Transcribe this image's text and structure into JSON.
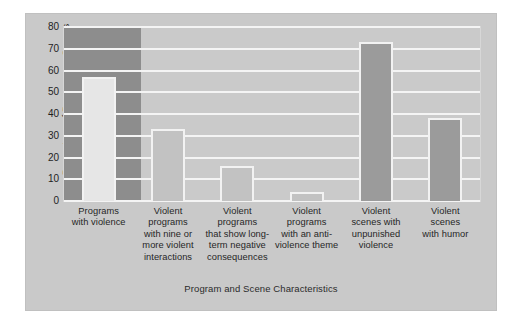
{
  "chart_data": {
    "type": "bar",
    "title": "",
    "xlabel": "Program and Scene Characteristics",
    "ylabel": "Percentage of Programs or Scenes",
    "ylim": [
      0,
      80
    ],
    "yticks": [
      0,
      10,
      20,
      30,
      40,
      50,
      60,
      70,
      80
    ],
    "grid": true,
    "legend": "none",
    "categories": [
      "Programs with violence",
      "Violent programs with nine or more violent interactions",
      "Violent programs that show long-term negative consequences",
      "Violent programs with an anti-violence theme",
      "Violent scenes with unpunished violence",
      "Violent scenes with humor"
    ],
    "category_lines": [
      [
        "Programs",
        "with violence"
      ],
      [
        "Violent",
        "programs",
        "with nine or",
        "more violent",
        "interactions"
      ],
      [
        "Violent",
        "programs",
        "that show long-",
        "term negative",
        "consequences"
      ],
      [
        "Violent",
        "programs",
        "with an anti-",
        "violence theme"
      ],
      [
        "Violent",
        "scenes with",
        "unpunished",
        "violence"
      ],
      [
        "Violent",
        "scenes",
        "with humor"
      ]
    ],
    "values": [
      57,
      33,
      16,
      4,
      73,
      38
    ],
    "bar_styles": [
      "light",
      "medium",
      "medium",
      "medium",
      "dark",
      "dark"
    ]
  },
  "colors": {
    "figure_background": "#ffffff",
    "plate_background": "#c9c9c9",
    "plot_background": "#cacaca",
    "gridline": "#f4f4f4",
    "highlight_band": "#8d8d8d",
    "bar_light": "#e6e6e6",
    "bar_medium": "#c2c2c2",
    "bar_dark": "#9b9b9b",
    "bar_edge": "#f2f2f2",
    "text": "#262626"
  }
}
